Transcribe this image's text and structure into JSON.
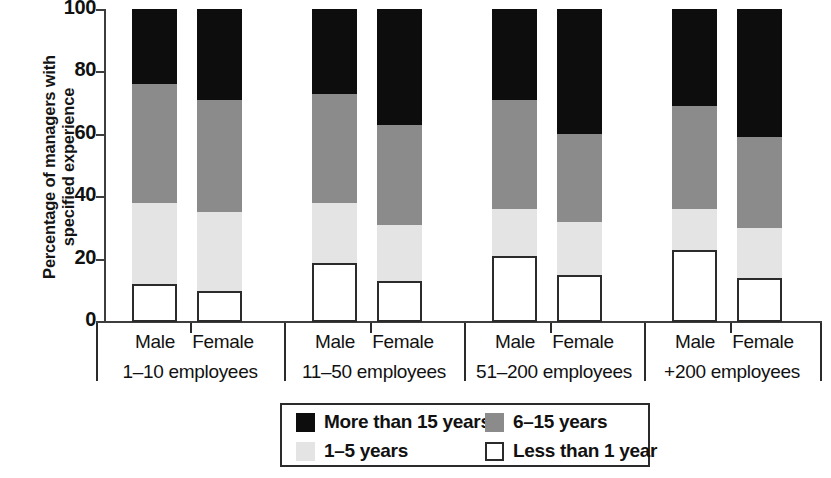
{
  "chart_data": {
    "type": "bar",
    "subtype": "stacked-bar-grouped",
    "title": "",
    "xlabel": "",
    "ylabel": "Percentage of managers with\nspecified experience",
    "ylim": [
      0,
      100
    ],
    "yticks": [
      0,
      20,
      40,
      60,
      80,
      100
    ],
    "grid": false,
    "stacked": true,
    "stack_total": 100,
    "legend_position": "bottom",
    "groups": [
      {
        "label": "1–10 employees",
        "subcategories": [
          "Male",
          "Female"
        ]
      },
      {
        "label": "11–50 employees",
        "subcategories": [
          "Male",
          "Female"
        ]
      },
      {
        "label": "51–200 employees",
        "subcategories": [
          "Male",
          "Female"
        ]
      },
      {
        "label": "+200 employees",
        "subcategories": [
          "Male",
          "Female"
        ]
      }
    ],
    "categories": [
      "1–10 employees / Male",
      "1–10 employees / Female",
      "11–50 employees / Male",
      "11–50 employees / Female",
      "51–200 employees / Male",
      "51–200 employees / Female",
      "+200 employees / Male",
      "+200 employees / Female"
    ],
    "series": [
      {
        "name": "Less than 1 year",
        "color": "#ffffff",
        "values": [
          12,
          10,
          19,
          13,
          21,
          15,
          23,
          14
        ]
      },
      {
        "name": "1–5 years",
        "color": "#e4e4e4",
        "values": [
          26,
          25,
          19,
          18,
          15,
          17,
          13,
          16
        ]
      },
      {
        "name": "6–15 years",
        "color": "#8b8b8b",
        "values": [
          38,
          36,
          35,
          32,
          35,
          28,
          33,
          29
        ]
      },
      {
        "name": "More than 15 years",
        "color": "#0d0d0d",
        "values": [
          24,
          29,
          27,
          37,
          29,
          40,
          31,
          41
        ]
      }
    ],
    "cumulative_tops": {
      "Less than 1 year": [
        12,
        10,
        19,
        13,
        21,
        15,
        23,
        14
      ],
      "1–5 years": [
        38,
        35,
        38,
        31,
        36,
        32,
        36,
        30
      ],
      "6–15 years": [
        76,
        71,
        73,
        63,
        71,
        60,
        69,
        59
      ],
      "More than 15 years": [
        100,
        100,
        100,
        100,
        100,
        100,
        100,
        100
      ]
    }
  },
  "axis": {
    "y_title": "Percentage of managers with\nspecified experience",
    "y_ticks": [
      "100",
      "80",
      "60",
      "40",
      "20",
      "0"
    ]
  },
  "groups": [
    {
      "name": "1–10 employees",
      "bars": [
        {
          "sex": "Male",
          "less_than_1": 12,
          "y1_5": 26,
          "y6_15": 38,
          "more_15": 24
        },
        {
          "sex": "Female",
          "less_than_1": 10,
          "y1_5": 25,
          "y6_15": 36,
          "more_15": 29
        }
      ]
    },
    {
      "name": "11–50 employees",
      "bars": [
        {
          "sex": "Male",
          "less_than_1": 19,
          "y1_5": 19,
          "y6_15": 35,
          "more_15": 27
        },
        {
          "sex": "Female",
          "less_than_1": 13,
          "y1_5": 18,
          "y6_15": 32,
          "more_15": 37
        }
      ]
    },
    {
      "name": "51–200 employees",
      "bars": [
        {
          "sex": "Male",
          "less_than_1": 21,
          "y1_5": 15,
          "y6_15": 35,
          "more_15": 29
        },
        {
          "sex": "Female",
          "less_than_1": 15,
          "y1_5": 17,
          "y6_15": 28,
          "more_15": 40
        }
      ]
    },
    {
      "name": "+200 employees",
      "bars": [
        {
          "sex": "Male",
          "less_than_1": 23,
          "y1_5": 13,
          "y6_15": 33,
          "more_15": 31
        },
        {
          "sex": "Female",
          "less_than_1": 14,
          "y1_5": 16,
          "y6_15": 29,
          "more_15": 41
        }
      ]
    }
  ],
  "legend": {
    "items": [
      {
        "label": "More than 15 years",
        "swatch": "black"
      },
      {
        "label": "6–15 years",
        "swatch": "gray"
      },
      {
        "label": "1–5 years",
        "swatch": "light"
      },
      {
        "label": "Less than 1 year",
        "swatch": "white"
      }
    ]
  },
  "colors": {
    "more_than_15": "#0d0d0d",
    "six_to_15": "#8b8b8b",
    "one_to_5": "#e4e4e4",
    "less_than_1": "#ffffff",
    "axis": "#3d3d3d",
    "text": "#111111"
  }
}
